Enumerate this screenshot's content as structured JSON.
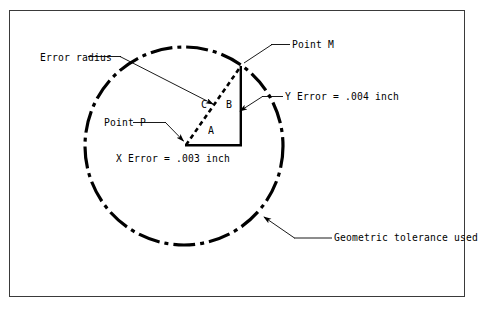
{
  "figure": {
    "type": "engineering-diagram",
    "background_color": "#ffffff",
    "line_color": "#000000",
    "frame_color": "#3a3a3a"
  },
  "labels": {
    "error_radius": "Error radius",
    "point_m": "Point M",
    "point_p": "Point P",
    "y_error": "Y Error = .004 inch",
    "x_error": "X Error = .003 inch",
    "geometric_tolerance": "Geometric tolerance used",
    "side_a": "A",
    "side_b": "B",
    "side_c": "C"
  },
  "geometry": {
    "tolerance_circle": {
      "center_x": 184,
      "center_y": 146,
      "radius": 99,
      "style": "dash-dot",
      "stroke_width": 3
    },
    "point_p": {
      "x": 186,
      "y": 145
    },
    "point_m": {
      "x": 241,
      "y": 67
    },
    "corner_right_angle": {
      "x": 241,
      "y": 145
    },
    "side_a_label_pos": {
      "x": 210,
      "y": 127
    },
    "side_b_label_pos": {
      "x": 228,
      "y": 104
    },
    "side_c_label_pos": {
      "x": 203,
      "y": 104
    }
  },
  "values": {
    "x_error_inch": 0.003,
    "y_error_inch": 0.004,
    "units": "inch"
  },
  "leaders": [
    {
      "name": "error-radius-leader",
      "from": {
        "x": 120,
        "y": 57
      },
      "to": {
        "x": 215,
        "y": 105
      },
      "arrow": true
    },
    {
      "name": "point-m-leader",
      "from": {
        "x": 272,
        "y": 45
      },
      "to": {
        "x": 243,
        "y": 64
      },
      "arrow": false
    },
    {
      "name": "point-p-leader",
      "from": {
        "x": 155,
        "y": 123
      },
      "to": {
        "x": 183,
        "y": 142
      },
      "arrow": true
    },
    {
      "name": "y-error-leader",
      "from": {
        "x": 262,
        "y": 97
      },
      "to": {
        "x": 240,
        "y": 110
      },
      "arrow": true
    },
    {
      "name": "geometric-tolerance-leader",
      "from": {
        "x": 295,
        "y": 238
      },
      "to": {
        "x": 262,
        "y": 218
      },
      "arrow": true
    }
  ]
}
